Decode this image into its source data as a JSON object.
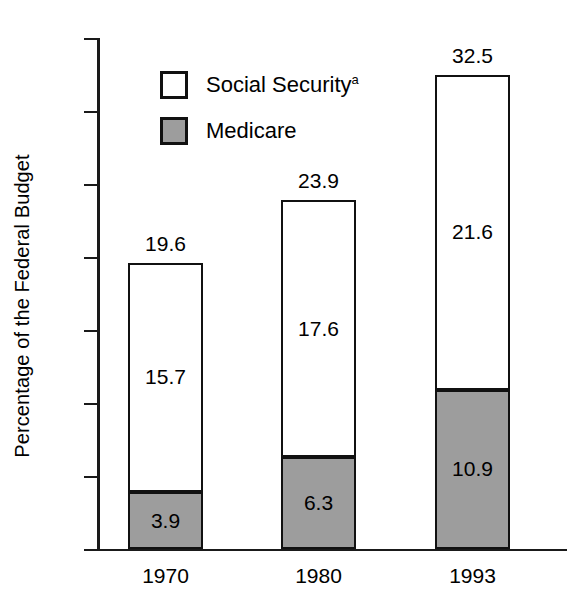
{
  "chart_data": {
    "type": "bar",
    "subtype": "stacked-bar",
    "title": "",
    "xlabel": "",
    "ylabel": "Percentage of the Federal Budget",
    "categories": [
      "1970",
      "1980",
      "1993"
    ],
    "ylim": [
      0,
      35
    ],
    "ytick_step": 5,
    "yticks": [
      "35",
      "30",
      "25",
      "20",
      "15",
      "10",
      "5",
      "0"
    ],
    "grid": false,
    "legend_position": "top-center-inside",
    "series": [
      {
        "name": "Social Security",
        "name_superscript": "a",
        "color": "#ffffff",
        "values": [
          15.7,
          17.6,
          21.6
        ],
        "labels": [
          "15.7",
          "17.6",
          "21.6"
        ]
      },
      {
        "name": "Medicare",
        "color": "#9d9d9d",
        "values": [
          3.9,
          6.3,
          10.9
        ],
        "labels": [
          "3.9",
          "6.3",
          "10.9"
        ]
      }
    ],
    "totals": [
      19.6,
      23.9,
      32.5
    ],
    "total_labels": [
      "19.6",
      "23.9",
      "32.5"
    ]
  },
  "colors": {
    "social_security_fill": "#ffffff",
    "medicare_fill": "#9d9d9d",
    "outline": "#111111",
    "text": "#000000",
    "background": "#ffffff"
  }
}
